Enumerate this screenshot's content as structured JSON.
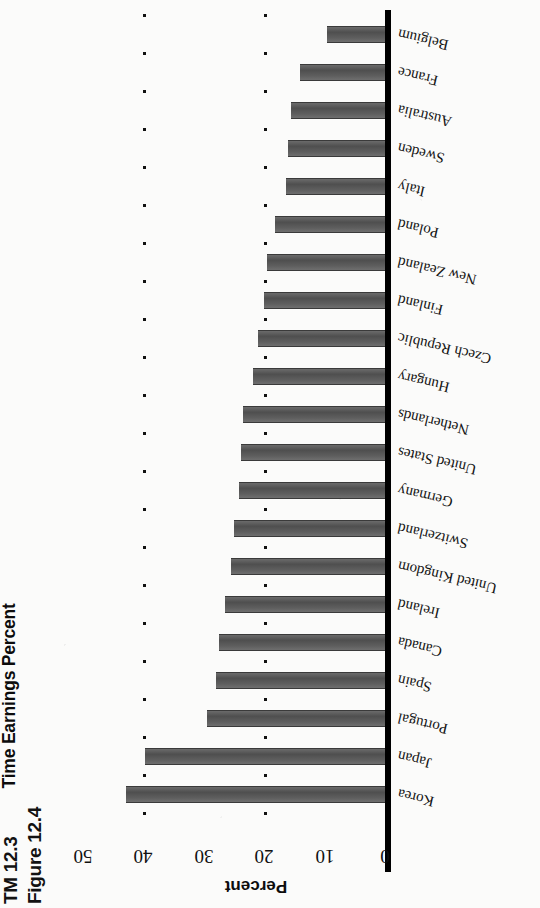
{
  "page": {
    "tm_label": "TM 12.3",
    "figure_label": "Figure 12.4"
  },
  "chart_data": {
    "type": "bar",
    "orientation": "horizontal",
    "title": "Female Wage Gap: Difference Between Female and Male Full-Time Earnings Percent",
    "xlabel": "",
    "ylabel": "Percent",
    "axis_title": "Percent",
    "xlim": [
      0,
      50
    ],
    "ylim": [
      0,
      50
    ],
    "grid": "dotted",
    "legend": "none",
    "tick_labels": [
      "0",
      "10",
      "20",
      "30",
      "40",
      "50"
    ],
    "ticks": [
      0,
      10,
      20,
      30,
      40,
      50
    ],
    "categories": [
      "Belgium",
      "France",
      "Australia",
      "Sweden",
      "Italy",
      "Poland",
      "New Zealand",
      "Finland",
      "Czech Republic",
      "Hungary",
      "Netherlands",
      "United States",
      "Germany",
      "Switzerland",
      "United Kingdom",
      "Ireland",
      "Canada",
      "Spain",
      "Portugal",
      "Japan",
      "Korea"
    ],
    "values": [
      9.6,
      14.0,
      15.5,
      16.0,
      16.3,
      18.2,
      19.5,
      20.0,
      21.0,
      21.8,
      23.5,
      23.8,
      24.2,
      25.0,
      25.5,
      26.5,
      27.5,
      28.0,
      29.5,
      39.7,
      42.8
    ],
    "bar_color": "#585858",
    "axis_color": "#000000"
  }
}
